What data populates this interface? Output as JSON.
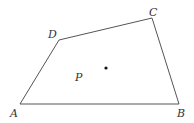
{
  "diagram": {
    "type": "quadrilateral",
    "stroke_color": "#555555",
    "point_color": "#111111",
    "vertices": [
      {
        "name": "A",
        "x": 20,
        "y": 104,
        "label_x": 10,
        "label_y": 117
      },
      {
        "name": "B",
        "x": 179,
        "y": 104,
        "label_x": 177,
        "label_y": 117
      },
      {
        "name": "C",
        "x": 152,
        "y": 18,
        "label_x": 149,
        "label_y": 16
      },
      {
        "name": "D",
        "x": 59,
        "y": 40,
        "label_x": 48,
        "label_y": 38
      }
    ],
    "interior_point": {
      "label": "P",
      "dot_x": 106,
      "dot_y": 68,
      "label_x": 75,
      "label_y": 81
    }
  },
  "labels": {
    "A": "A",
    "B": "B",
    "C": "C",
    "D": "D",
    "P": "P"
  }
}
